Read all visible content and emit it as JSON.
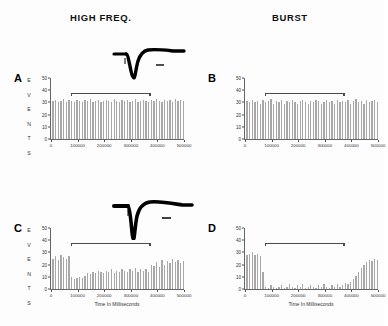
{
  "figure": {
    "columns": [
      {
        "id": "high-freq",
        "label": "HIGH FREQ."
      },
      {
        "id": "burst",
        "label": "BURST"
      }
    ],
    "axis": {
      "xlabel": "Time In Milliseconds",
      "ylabel_letters": [
        "E",
        "V",
        "E",
        "N",
        "T",
        "S"
      ],
      "ylabel": "EVENTS",
      "yticks": [
        0,
        10,
        20,
        30,
        40,
        50
      ],
      "xticks": [
        0,
        100000,
        200000,
        300000,
        400000,
        500000
      ],
      "xtick_labels": [
        "0",
        "100000",
        "200000",
        "300000",
        "400000",
        "500000"
      ],
      "ylim": [
        0,
        50
      ],
      "xlim": [
        0,
        500000
      ]
    },
    "colors": {
      "bar": "#a8a8a8",
      "axis": "#666666",
      "stimulus_bar": "#4a4a4a",
      "text": "#111111",
      "background": "#ffffff"
    },
    "insets": [
      {
        "id": "inset-trace-top",
        "name": "evoked-response-trace-high-freq"
      },
      {
        "id": "inset-trace-mid",
        "name": "evoked-response-trace-burst"
      }
    ]
  },
  "chart_data": [
    {
      "id": "A",
      "type": "bar",
      "panel_letter": "A",
      "title": "HIGH FREQ.",
      "xlabel": "",
      "ylabel": "EVENTS",
      "ylim": [
        0,
        50
      ],
      "xlim": [
        0,
        500000
      ],
      "grid": false,
      "show_xtitle": false,
      "stimulus": {
        "start": 75000,
        "end": 370000,
        "label": "stimulation period"
      },
      "x": [
        5000,
        15000,
        25000,
        35000,
        45000,
        55000,
        65000,
        75000,
        85000,
        95000,
        105000,
        115000,
        125000,
        135000,
        145000,
        155000,
        165000,
        175000,
        185000,
        195000,
        205000,
        215000,
        225000,
        235000,
        245000,
        255000,
        265000,
        275000,
        285000,
        295000,
        305000,
        315000,
        325000,
        335000,
        345000,
        355000,
        365000,
        375000,
        385000,
        395000,
        405000,
        415000,
        425000,
        435000,
        445000,
        455000,
        465000,
        475000,
        485000,
        495000
      ],
      "values": [
        31,
        32,
        30,
        31,
        33,
        30,
        32,
        31,
        30,
        32,
        31,
        30,
        32,
        31,
        33,
        30,
        31,
        32,
        30,
        31,
        32,
        31,
        30,
        33,
        31,
        30,
        32,
        31,
        32,
        30,
        31,
        33,
        30,
        31,
        32,
        31,
        30,
        32,
        31,
        33,
        31,
        30,
        32,
        31,
        32,
        30,
        33,
        31,
        32,
        31
      ]
    },
    {
      "id": "B",
      "type": "bar",
      "panel_letter": "B",
      "title": "BURST",
      "xlabel": "",
      "ylabel": "",
      "ylim": [
        0,
        50
      ],
      "xlim": [
        0,
        500000
      ],
      "grid": false,
      "show_xtitle": false,
      "stimulus": {
        "start": 75000,
        "end": 370000,
        "label": "stimulation period"
      },
      "x": [
        5000,
        15000,
        25000,
        35000,
        45000,
        55000,
        65000,
        75000,
        85000,
        95000,
        105000,
        115000,
        125000,
        135000,
        145000,
        155000,
        165000,
        175000,
        185000,
        195000,
        205000,
        215000,
        225000,
        235000,
        245000,
        255000,
        265000,
        275000,
        285000,
        295000,
        305000,
        315000,
        325000,
        335000,
        345000,
        355000,
        365000,
        375000,
        385000,
        395000,
        405000,
        415000,
        425000,
        435000,
        445000,
        455000,
        465000,
        475000,
        485000,
        495000
      ],
      "values": [
        31,
        30,
        32,
        30,
        31,
        29,
        32,
        30,
        31,
        33,
        29,
        31,
        30,
        32,
        29,
        31,
        30,
        32,
        30,
        29,
        31,
        32,
        30,
        29,
        31,
        30,
        32,
        31,
        29,
        30,
        32,
        30,
        31,
        29,
        32,
        30,
        31,
        30,
        32,
        29,
        31,
        33,
        30,
        31,
        29,
        32,
        30,
        31,
        32,
        30
      ]
    },
    {
      "id": "C",
      "type": "bar",
      "panel_letter": "C",
      "title": "",
      "xlabel": "Time In Milliseconds",
      "ylabel": "EVENTS",
      "ylim": [
        0,
        50
      ],
      "xlim": [
        0,
        500000
      ],
      "grid": false,
      "show_xtitle": true,
      "stimulus": {
        "start": 75000,
        "end": 370000,
        "label": "stimulation period"
      },
      "x": [
        5000,
        15000,
        25000,
        35000,
        45000,
        55000,
        65000,
        75000,
        85000,
        95000,
        105000,
        115000,
        125000,
        135000,
        145000,
        155000,
        165000,
        175000,
        185000,
        195000,
        205000,
        215000,
        225000,
        235000,
        245000,
        255000,
        265000,
        275000,
        285000,
        295000,
        305000,
        315000,
        325000,
        335000,
        345000,
        355000,
        365000,
        375000,
        385000,
        395000,
        405000,
        415000,
        425000,
        435000,
        445000,
        455000,
        465000,
        475000,
        485000,
        495000
      ],
      "values": [
        25,
        27,
        24,
        28,
        26,
        25,
        27,
        10,
        8,
        9,
        10,
        9,
        11,
        13,
        12,
        14,
        13,
        15,
        14,
        13,
        15,
        14,
        16,
        13,
        15,
        14,
        16,
        15,
        14,
        16,
        15,
        17,
        14,
        16,
        15,
        16,
        14,
        20,
        19,
        22,
        18,
        24,
        20,
        23,
        21,
        25,
        22,
        24,
        21,
        23
      ]
    },
    {
      "id": "D",
      "type": "bar",
      "panel_letter": "D",
      "title": "",
      "xlabel": "Time In Milliseconds",
      "ylabel": "",
      "ylim": [
        0,
        50
      ],
      "xlim": [
        0,
        500000
      ],
      "grid": false,
      "show_xtitle": true,
      "stimulus": {
        "start": 75000,
        "end": 370000,
        "label": "stimulation period"
      },
      "x": [
        5000,
        15000,
        25000,
        35000,
        45000,
        55000,
        65000,
        75000,
        85000,
        95000,
        105000,
        115000,
        125000,
        135000,
        145000,
        155000,
        165000,
        175000,
        185000,
        195000,
        205000,
        215000,
        225000,
        235000,
        245000,
        255000,
        265000,
        275000,
        285000,
        295000,
        305000,
        315000,
        325000,
        335000,
        345000,
        355000,
        365000,
        375000,
        385000,
        395000,
        405000,
        415000,
        425000,
        435000,
        445000,
        455000,
        465000,
        475000,
        485000,
        495000
      ],
      "values": [
        28,
        29,
        30,
        28,
        29,
        27,
        14,
        2,
        1,
        3,
        2,
        1,
        2,
        3,
        1,
        2,
        4,
        2,
        1,
        3,
        2,
        4,
        1,
        2,
        3,
        2,
        1,
        3,
        2,
        4,
        2,
        1,
        3,
        2,
        4,
        2,
        3,
        5,
        4,
        6,
        8,
        11,
        14,
        17,
        20,
        22,
        24,
        23,
        25,
        24
      ]
    }
  ]
}
